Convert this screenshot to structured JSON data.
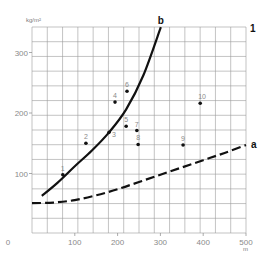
{
  "chart_data": {
    "type": "scatter",
    "title": "",
    "xlabel": "m",
    "ylabel": "kg/m²",
    "xlim": [
      0,
      500
    ],
    "ylim": [
      0,
      340
    ],
    "x_ticks": [
      0,
      100,
      200,
      300,
      400,
      500
    ],
    "y_ticks": [
      100,
      200,
      300
    ],
    "x_tick_labels": [
      "0",
      "100",
      "200",
      "300",
      "400",
      "500"
    ],
    "y_tick_labels": [
      "100",
      "200",
      "300"
    ],
    "grid": true,
    "grid_columns": 14,
    "grid_rows": 14,
    "panel_label": "1",
    "points": [
      {
        "label": "1",
        "x": 72,
        "y": 98
      },
      {
        "label": "2",
        "x": 126,
        "y": 150
      },
      {
        "label": "3",
        "x": 180,
        "y": 168
      },
      {
        "label": "4",
        "x": 194,
        "y": 218
      },
      {
        "label": "5",
        "x": 220,
        "y": 178
      },
      {
        "label": "6",
        "x": 222,
        "y": 236
      },
      {
        "label": "7",
        "x": 245,
        "y": 171
      },
      {
        "label": "8",
        "x": 248,
        "y": 148
      },
      {
        "label": "9",
        "x": 353,
        "y": 147
      },
      {
        "label": "10",
        "x": 393,
        "y": 216
      }
    ],
    "series": [
      {
        "name": "b",
        "style": "solid",
        "x": [
          23,
          60,
          100,
          140,
          180,
          220,
          260,
          301
        ],
        "values": [
          63,
          85,
          112,
          138,
          168,
          206,
          262,
          342
        ]
      },
      {
        "name": "a",
        "style": "dashed",
        "x": [
          0,
          50,
          100,
          150,
          200,
          250,
          300,
          350,
          400,
          450,
          500
        ],
        "values": [
          51,
          52,
          56,
          64,
          74,
          86,
          98,
          110,
          122,
          134,
          147
        ]
      }
    ]
  }
}
